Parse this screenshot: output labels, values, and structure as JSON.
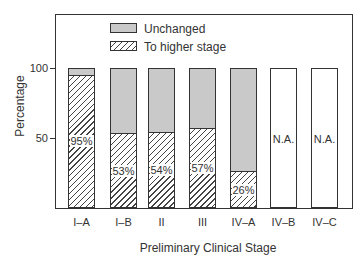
{
  "chart_data": {
    "type": "bar",
    "stacked": true,
    "title": "",
    "xlabel": "Preliminary Clinical Stage",
    "ylabel": "Percentage",
    "ylim": [
      0,
      139
    ],
    "yticks": [
      50,
      100
    ],
    "ytick_labels": [
      "50",
      "100"
    ],
    "grid": false,
    "legend_position": "upper-left-inside",
    "categories": [
      "I–A",
      "I–B",
      "II",
      "III",
      "IV–A",
      "IV–B",
      "IV–C"
    ],
    "series": [
      {
        "name": "To higher stage",
        "pattern": "hatched",
        "values": [
          95,
          53,
          54,
          57,
          26,
          null,
          null
        ]
      },
      {
        "name": "Unchanged",
        "color": "#c9c9c9",
        "values": [
          5,
          47,
          46,
          43,
          74,
          null,
          null
        ]
      }
    ],
    "bar_labels": [
      "95%",
      "53%",
      "54%",
      "57%",
      "26%",
      "N.A.",
      "N.A."
    ],
    "not_available": [
      false,
      false,
      false,
      false,
      false,
      true,
      true
    ]
  },
  "legend": {
    "items": [
      {
        "label": "Unchanged"
      },
      {
        "label": "To higher stage"
      }
    ]
  },
  "axes": {
    "xlabel": "Preliminary Clinical Stage",
    "ylabel": "Percentage",
    "ytick_50": "50",
    "ytick_100": "100"
  }
}
